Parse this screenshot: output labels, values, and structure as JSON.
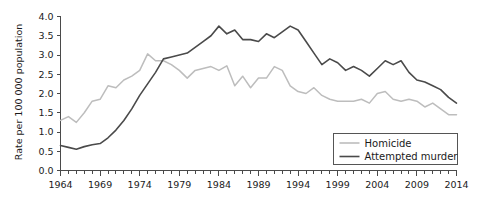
{
  "chart_data": {
    "type": "line",
    "title": "",
    "xlabel": "",
    "ylabel": "Rate per 100 000 population",
    "xlim": [
      1964,
      2014
    ],
    "ylim": [
      0.0,
      4.0
    ],
    "grid": false,
    "legend_position": "bottom-right",
    "y_ticks": [
      "0.0",
      "0.5",
      "1.0",
      "1.5",
      "2.0",
      "2.5",
      "3.0",
      "3.5",
      "4.0"
    ],
    "y_tick_values": [
      0.0,
      0.5,
      1.0,
      1.5,
      2.0,
      2.5,
      3.0,
      3.5,
      4.0
    ],
    "x_ticks": [
      "1964",
      "1969",
      "1974",
      "1979",
      "1984",
      "1989",
      "1994",
      "1999",
      "2004",
      "2009",
      "2014"
    ],
    "x_tick_values": [
      1964,
      1969,
      1974,
      1979,
      1984,
      1989,
      1994,
      1999,
      2004,
      2009,
      2014
    ],
    "x_minor_step": 1,
    "x": [
      1964,
      1965,
      1966,
      1967,
      1968,
      1969,
      1970,
      1971,
      1972,
      1973,
      1974,
      1975,
      1976,
      1977,
      1978,
      1979,
      1980,
      1981,
      1982,
      1983,
      1984,
      1985,
      1986,
      1987,
      1988,
      1989,
      1990,
      1991,
      1992,
      1993,
      1994,
      1995,
      1996,
      1997,
      1998,
      1999,
      2000,
      2001,
      2002,
      2003,
      2004,
      2005,
      2006,
      2007,
      2008,
      2009,
      2010,
      2011,
      2012,
      2013,
      2014
    ],
    "series": [
      {
        "name": "Homicide",
        "color": "#bdbdbd",
        "values": [
          1.3,
          1.4,
          1.25,
          1.5,
          1.8,
          1.85,
          2.2,
          2.15,
          2.35,
          2.45,
          2.6,
          3.03,
          2.85,
          2.85,
          2.75,
          2.6,
          2.4,
          2.6,
          2.65,
          2.7,
          2.6,
          2.72,
          2.2,
          2.45,
          2.15,
          2.4,
          2.4,
          2.7,
          2.6,
          2.2,
          2.05,
          2.0,
          2.15,
          1.95,
          1.85,
          1.8,
          1.8,
          1.8,
          1.85,
          1.75,
          2.0,
          2.05,
          1.85,
          1.8,
          1.85,
          1.8,
          1.65,
          1.75,
          1.6,
          1.45,
          1.45
        ]
      },
      {
        "name": "Attempted murder",
        "color": "#4a4a4a",
        "values": [
          0.65,
          0.6,
          0.55,
          0.62,
          0.67,
          0.7,
          0.85,
          1.05,
          1.3,
          1.6,
          1.95,
          2.25,
          2.55,
          2.9,
          2.95,
          3.0,
          3.05,
          3.2,
          3.35,
          3.5,
          3.75,
          3.55,
          3.65,
          3.4,
          3.4,
          3.35,
          3.55,
          3.45,
          3.6,
          3.75,
          3.65,
          3.35,
          3.05,
          2.75,
          2.9,
          2.8,
          2.6,
          2.7,
          2.6,
          2.45,
          2.65,
          2.85,
          2.75,
          2.85,
          2.55,
          2.35,
          2.3,
          2.2,
          2.1,
          1.9,
          1.75
        ]
      }
    ]
  }
}
